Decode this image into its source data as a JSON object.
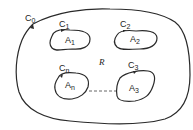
{
  "diagram": {
    "stroke_color": "#2a2a2a",
    "outer_curve": {
      "label": "C",
      "sub": "0"
    },
    "region_label": "R",
    "holes": [
      {
        "curve_label": "C",
        "curve_sub": "1",
        "area_label": "A",
        "area_sub": "1"
      },
      {
        "curve_label": "C",
        "curve_sub": "2",
        "area_label": "A",
        "area_sub": "2"
      },
      {
        "curve_label": "C",
        "curve_sub": "3",
        "area_label": "A",
        "area_sub": "3"
      },
      {
        "curve_label": "C",
        "curve_sub": "n",
        "area_label": "A",
        "area_sub": "n"
      }
    ]
  }
}
